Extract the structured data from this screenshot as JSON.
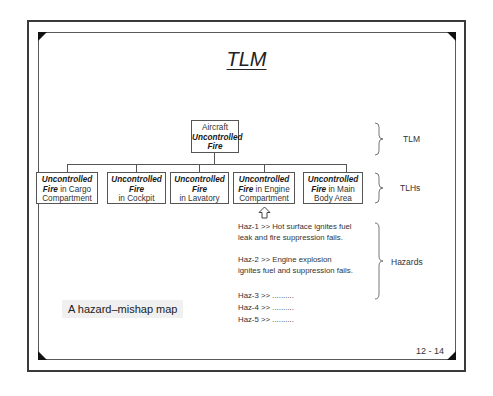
{
  "slide": {
    "title": "TLM",
    "caption": "A hazard–mishap map",
    "page_number": "12 - 14"
  },
  "tree": {
    "root": {
      "line1": "Aircraft",
      "bold1": "Uncontrolled",
      "bold2": "Fire"
    },
    "children": [
      {
        "bold": "Uncontrolled",
        "bold2": "Fire",
        "rest": " in Cargo",
        "line3": "Compartment"
      },
      {
        "bold": "Uncontrolled",
        "bold2": "Fire",
        "line3": "in Cockpit"
      },
      {
        "bold": "Uncontrolled",
        "bold2": "Fire",
        "line3": "in Lavatory"
      },
      {
        "bold": "Uncontrolled",
        "bold2": "Fire",
        "rest": " in Engine",
        "line3": "Compartment"
      },
      {
        "bold": "Uncontrolled",
        "bold2": "Fire",
        "rest": " in Main",
        "line3": "Body Area"
      }
    ]
  },
  "braces": {
    "tlm": "TLM",
    "tlhs": "TLHs",
    "hazards": "Hazards"
  },
  "hazards": [
    {
      "line1": "Haz-1 >> Hot surface ignites fuel",
      "line2": "leak and fire suppression fails."
    },
    {
      "line1": "Haz-2 >> Engine explosion",
      "line2": "ignites fuel and suppression fails."
    },
    {
      "line1": "Haz-3 >> .........."
    },
    {
      "line1": "Haz-4 >> .........."
    },
    {
      "line1": "Haz-5 >> .........."
    }
  ],
  "icons": {
    "arrow": "up-arrow-icon"
  }
}
